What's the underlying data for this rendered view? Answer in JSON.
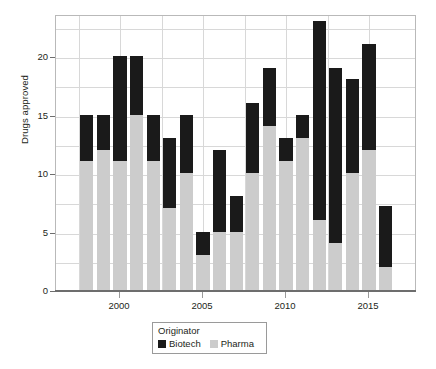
{
  "chart_data": {
    "type": "bar",
    "title": "",
    "subtitle": "",
    "xlabel": "",
    "ylabel": "Drugs approved",
    "stacked": true,
    "grid": true,
    "legend_position": "bottom",
    "legend_title": "Originator",
    "ylim": [
      0,
      24
    ],
    "yticks": [
      0,
      5,
      10,
      15,
      20
    ],
    "xlim": [
      1997.3,
      1916.7
    ],
    "xticks": [
      2000,
      2005,
      2010,
      2015
    ],
    "xtick_labels": [
      "2000",
      "2005",
      "2010",
      "2015"
    ],
    "categories": [
      1998,
      1999,
      2000,
      2001,
      2002,
      2003,
      2004,
      2005,
      2006,
      2007,
      2008,
      2009,
      2010,
      2011,
      2012,
      2013,
      2014,
      2015,
      2016
    ],
    "series": [
      {
        "name": "Pharma",
        "color": "#cccccc",
        "values": [
          11,
          12,
          11,
          15,
          11,
          7,
          10,
          3,
          5,
          5,
          10,
          14,
          11,
          13,
          6,
          4,
          10,
          12,
          2
        ]
      },
      {
        "name": "Biotech",
        "color": "#1a1a1a",
        "values": [
          4,
          3,
          9,
          5,
          4,
          6,
          5,
          2,
          7,
          3,
          6,
          5,
          2,
          2,
          17,
          15,
          8,
          9,
          5.2
        ]
      }
    ],
    "totals": [
      15,
      15,
      20,
      20,
      15,
      13,
      15,
      5,
      12,
      8,
      16,
      19.2,
      13,
      15.2,
      23,
      19.2,
      18.2,
      21.2,
      7.2
    ]
  },
  "legend": {
    "title": "Originator",
    "entries": [
      {
        "label": "Biotech",
        "color": "#1a1a1a"
      },
      {
        "label": "Pharma",
        "color": "#cccccc"
      }
    ]
  },
  "axes": {
    "y_title": "Drugs approved",
    "y_tick_labels": [
      "0",
      "5",
      "10",
      "15",
      "20"
    ],
    "x_tick_labels": [
      "2000",
      "2005",
      "2010",
      "2015"
    ]
  }
}
